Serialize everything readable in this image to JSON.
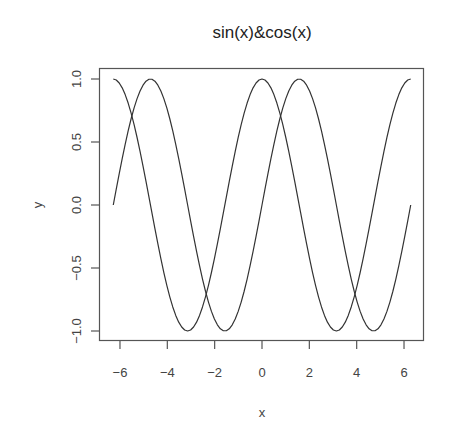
{
  "chart_data": {
    "type": "line",
    "title": "sin(x)&cos(x)",
    "xlabel": "x",
    "ylabel": "y",
    "xlim": [
      -6.6,
      6.6
    ],
    "ylim": [
      -1.08,
      1.08
    ],
    "x_ticks": [
      -6,
      -4,
      -2,
      0,
      2,
      4,
      6
    ],
    "x_tick_labels": [
      "-6",
      "-4",
      "-2",
      "0",
      "2",
      "4",
      "6"
    ],
    "y_ticks": [
      -1.0,
      -0.5,
      0.0,
      0.5,
      1.0
    ],
    "y_tick_labels": [
      "-1.0",
      "-0.5",
      "0.0",
      "0.5",
      "1.0"
    ],
    "grid": false,
    "legend": null,
    "x_range": [
      -6.283185,
      6.283185
    ],
    "num_points": 101,
    "series": [
      {
        "name": "sin(x)",
        "function": "sin",
        "color": "#333333"
      },
      {
        "name": "cos(x)",
        "function": "cos",
        "color": "#333333"
      }
    ]
  }
}
